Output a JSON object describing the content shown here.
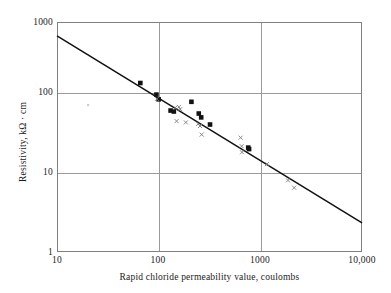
{
  "chart_data": {
    "type": "scatter",
    "title": "",
    "xlabel": "Rapid chloride permeability value, coulombs",
    "ylabel": "Resistivity, kΩ · cm",
    "xscale": "log",
    "yscale": "log",
    "xlim": [
      10,
      10000
    ],
    "ylim": [
      1,
      1000
    ],
    "xticks": [
      10,
      100,
      1000,
      10000
    ],
    "xticklabels": [
      "10",
      "100",
      "1000",
      "10,000"
    ],
    "yticks": [
      1,
      10,
      100,
      1000
    ],
    "yticklabels": [
      "1",
      "10",
      "100",
      "1000"
    ],
    "grid": true,
    "legend": "none",
    "series": [
      {
        "name": "filled-square-series",
        "marker": "filled-square",
        "color": "#111111",
        "points": [
          {
            "x": 66,
            "y": 160
          },
          {
            "x": 95,
            "y": 113
          },
          {
            "x": 100,
            "y": 98
          },
          {
            "x": 131,
            "y": 70
          },
          {
            "x": 141,
            "y": 68
          },
          {
            "x": 210,
            "y": 91
          },
          {
            "x": 248,
            "y": 64
          },
          {
            "x": 262,
            "y": 57
          },
          {
            "x": 320,
            "y": 46
          },
          {
            "x": 760,
            "y": 23
          },
          {
            "x": 775,
            "y": 22
          }
        ]
      },
      {
        "name": "x-marker-series",
        "marker": "x",
        "color": "#7d7d7d",
        "points": [
          {
            "x": 96,
            "y": 99
          },
          {
            "x": 145,
            "y": 76
          },
          {
            "x": 158,
            "y": 78
          },
          {
            "x": 163,
            "y": 73
          },
          {
            "x": 150,
            "y": 51
          },
          {
            "x": 185,
            "y": 49
          },
          {
            "x": 245,
            "y": 47
          },
          {
            "x": 255,
            "y": 44
          },
          {
            "x": 265,
            "y": 34
          },
          {
            "x": 640,
            "y": 31
          },
          {
            "x": 655,
            "y": 24
          },
          {
            "x": 660,
            "y": 20
          },
          {
            "x": 1160,
            "y": 14
          },
          {
            "x": 1870,
            "y": 8.6
          },
          {
            "x": 2150,
            "y": 6.9
          }
        ]
      }
    ],
    "trendline": {
      "name": "power-law-fit",
      "from": {
        "x": 10,
        "y": 660
      },
      "to": {
        "x": 10000,
        "y": 2.4
      },
      "color": "#111111"
    }
  }
}
